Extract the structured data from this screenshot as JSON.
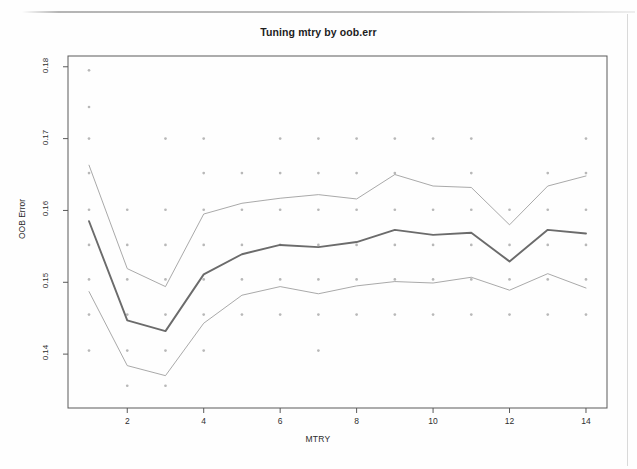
{
  "figure": {
    "title": "Tuning mtry by oob.err",
    "xlabel": "MTRY",
    "ylabel": "OOB Error"
  },
  "axis": {
    "y_ticks": [
      "0.14",
      "0.15",
      "0.16",
      "0.17",
      "0.18"
    ],
    "x_ticks": [
      "2",
      "4",
      "6",
      "8",
      "10",
      "12",
      "14"
    ]
  },
  "colors": {
    "mean_line": "#6b6b6b",
    "band_line": "#9a9a9a",
    "point": "#b8b8b8",
    "axis": "#5a5a5a",
    "text": "#1d1d1d",
    "background": "#fefefe"
  },
  "chart_data": {
    "type": "line",
    "title": "Tuning mtry by oob.err",
    "xlabel": "MTRY",
    "ylabel": "OOB Error",
    "xlim": [
      0.45,
      14.55
    ],
    "ylim": [
      0.1325,
      0.1815
    ],
    "x_ticks": [
      2,
      4,
      6,
      8,
      10,
      12,
      14
    ],
    "y_ticks": [
      0.14,
      0.15,
      0.16,
      0.17,
      0.18
    ],
    "grid": false,
    "legend": "none",
    "x": [
      1,
      2,
      3,
      4,
      5,
      6,
      7,
      8,
      9,
      10,
      11,
      12,
      13,
      14
    ],
    "series": [
      {
        "name": "mean OOB error",
        "style": "thick-line",
        "values": [
          0.1585,
          0.1447,
          0.1432,
          0.1511,
          0.1539,
          0.1552,
          0.1549,
          0.1556,
          0.1573,
          0.1566,
          0.1569,
          0.1529,
          0.1573,
          0.1568
        ]
      },
      {
        "name": "upper bound",
        "style": "thin-line",
        "values": [
          0.1663,
          0.1519,
          0.1494,
          0.1595,
          0.161,
          0.1617,
          0.1622,
          0.1616,
          0.165,
          0.1634,
          0.1632,
          0.158,
          0.1634,
          0.1648
        ]
      },
      {
        "name": "lower bound",
        "style": "thin-line",
        "values": [
          0.1487,
          0.1384,
          0.137,
          0.1443,
          0.1482,
          0.1494,
          0.1484,
          0.1495,
          0.1501,
          0.1499,
          0.1507,
          0.1489,
          0.1512,
          0.1492
        ]
      }
    ],
    "scatter": {
      "name": "individual repetitions",
      "marker": "dot",
      "points": [
        [
          1,
          0.1795
        ],
        [
          1,
          0.1744
        ],
        [
          1,
          0.17
        ],
        [
          1,
          0.1652
        ],
        [
          1,
          0.1601
        ],
        [
          1,
          0.1552
        ],
        [
          1,
          0.1504
        ],
        [
          1,
          0.1455
        ],
        [
          1,
          0.1405
        ],
        [
          2,
          0.1601
        ],
        [
          2,
          0.1552
        ],
        [
          2,
          0.1504
        ],
        [
          2,
          0.1455
        ],
        [
          2,
          0.1405
        ],
        [
          2,
          0.1356
        ],
        [
          3,
          0.17
        ],
        [
          3,
          0.1601
        ],
        [
          3,
          0.1552
        ],
        [
          3,
          0.1504
        ],
        [
          3,
          0.1455
        ],
        [
          3,
          0.1405
        ],
        [
          3,
          0.1356
        ],
        [
          4,
          0.17
        ],
        [
          4,
          0.1652
        ],
        [
          4,
          0.1601
        ],
        [
          4,
          0.1552
        ],
        [
          4,
          0.1504
        ],
        [
          4,
          0.1455
        ],
        [
          4,
          0.1405
        ],
        [
          5,
          0.1652
        ],
        [
          5,
          0.1601
        ],
        [
          5,
          0.1552
        ],
        [
          5,
          0.1504
        ],
        [
          5,
          0.1455
        ],
        [
          6,
          0.17
        ],
        [
          6,
          0.1652
        ],
        [
          6,
          0.1601
        ],
        [
          6,
          0.1552
        ],
        [
          6,
          0.1504
        ],
        [
          6,
          0.1455
        ],
        [
          7,
          0.17
        ],
        [
          7,
          0.1652
        ],
        [
          7,
          0.1601
        ],
        [
          7,
          0.1552
        ],
        [
          7,
          0.1504
        ],
        [
          7,
          0.1455
        ],
        [
          7,
          0.1405
        ],
        [
          8,
          0.17
        ],
        [
          8,
          0.1652
        ],
        [
          8,
          0.1601
        ],
        [
          8,
          0.1552
        ],
        [
          8,
          0.1504
        ],
        [
          8,
          0.1455
        ],
        [
          9,
          0.17
        ],
        [
          9,
          0.1652
        ],
        [
          9,
          0.1601
        ],
        [
          9,
          0.1552
        ],
        [
          9,
          0.1504
        ],
        [
          9,
          0.1455
        ],
        [
          10,
          0.17
        ],
        [
          10,
          0.1601
        ],
        [
          10,
          0.1552
        ],
        [
          10,
          0.1504
        ],
        [
          10,
          0.1455
        ],
        [
          11,
          0.17
        ],
        [
          11,
          0.1652
        ],
        [
          11,
          0.1601
        ],
        [
          11,
          0.1552
        ],
        [
          11,
          0.1504
        ],
        [
          11,
          0.1455
        ],
        [
          12,
          0.1601
        ],
        [
          12,
          0.1552
        ],
        [
          12,
          0.1504
        ],
        [
          12,
          0.1455
        ],
        [
          13,
          0.1652
        ],
        [
          13,
          0.1601
        ],
        [
          13,
          0.1552
        ],
        [
          13,
          0.1504
        ],
        [
          13,
          0.1455
        ],
        [
          14,
          0.17
        ],
        [
          14,
          0.1652
        ],
        [
          14,
          0.1601
        ],
        [
          14,
          0.1552
        ],
        [
          14,
          0.1504
        ],
        [
          14,
          0.1455
        ]
      ]
    }
  }
}
